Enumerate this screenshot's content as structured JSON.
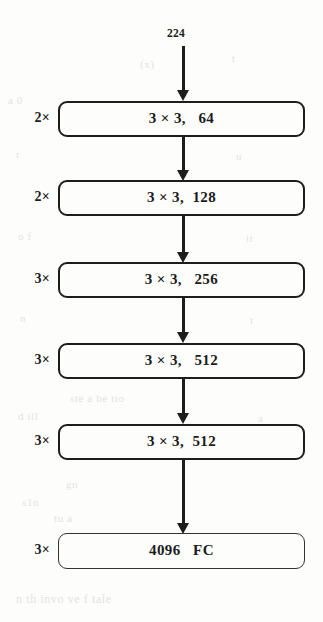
{
  "figure": {
    "type": "neural-network-architecture-diagram",
    "input_size_label": "224",
    "background_color": "#fdfdfc",
    "stroke_color": "#1d1d1d",
    "layers": [
      {
        "multiplier": "2×",
        "label": "3 × 3,   64",
        "kernel": "3 × 3",
        "channels": "64",
        "kind": "conv"
      },
      {
        "multiplier": "2×",
        "label": "3 × 3,  128",
        "kernel": "3 × 3",
        "channels": "128",
        "kind": "conv"
      },
      {
        "multiplier": "3×",
        "label": "3 × 3,   256",
        "kernel": "3 × 3",
        "channels": "256",
        "kind": "conv"
      },
      {
        "multiplier": "3×",
        "label": "3 × 3,   512",
        "kernel": "3 × 3",
        "channels": "512",
        "kind": "conv"
      },
      {
        "multiplier": "3×",
        "label": "3 × 3,  512",
        "kernel": "3 × 3",
        "channels": "512",
        "kind": "conv"
      },
      {
        "multiplier": "3×",
        "label": "4096   FC",
        "kernel": "",
        "channels": "4096",
        "kind": "fc"
      }
    ],
    "bleed_through_text": [
      "a 0",
      "(x)",
      "t",
      "r",
      "u",
      "o f",
      "it",
      "n",
      "t",
      "ste a be tio",
      "d ill",
      "a",
      "gn",
      "s1n",
      "tu a",
      "n th  invo ve  f tale"
    ]
  }
}
